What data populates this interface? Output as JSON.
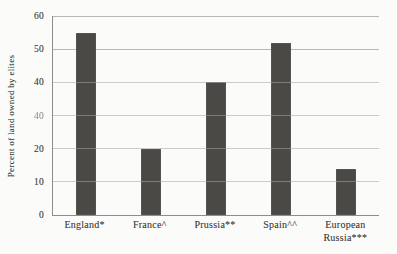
{
  "figure": {
    "background": "#fbfbf9",
    "bar_color": "#4a4946",
    "gridline_color": "#b9b8b3",
    "axis_color": "#8e8d88",
    "text_color": "#45443e"
  },
  "chart_data": {
    "type": "bar",
    "categories": [
      "England*",
      "France^",
      "Prussia**",
      "Spain^^",
      "European Russia***"
    ],
    "values": [
      55,
      20,
      40,
      52,
      14
    ],
    "title": "",
    "xlabel": "",
    "ylabel": "Percent of land owned by elites",
    "ylim": [
      0,
      60
    ],
    "ytick_values": [
      0,
      10,
      20,
      30,
      40,
      50,
      60
    ],
    "ytick_labels_top_to_bottom": [
      "60",
      "50",
      "40",
      "40",
      "20",
      "10",
      "0"
    ],
    "grid": "horizontal gridlines on",
    "legend": "none"
  },
  "y_axis": {
    "title": "Percent of land owned by elites",
    "ticks": [
      {
        "label": "60",
        "value": 60
      },
      {
        "label": "50",
        "value": 50
      },
      {
        "label": "40",
        "value": 40
      },
      {
        "label": "40",
        "value": 30
      },
      {
        "label": "20",
        "value": 20
      },
      {
        "label": "10",
        "value": 10
      },
      {
        "label": "0",
        "value": 0
      }
    ]
  },
  "x_axis": {
    "labels": [
      {
        "line1": "England*",
        "line2": ""
      },
      {
        "line1": "France^",
        "line2": ""
      },
      {
        "line1": "Prussia**",
        "line2": ""
      },
      {
        "line1": "Spain^^",
        "line2": ""
      },
      {
        "line1": "European",
        "line2": "Russia***"
      }
    ]
  }
}
